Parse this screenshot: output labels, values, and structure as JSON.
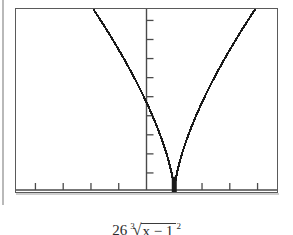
{
  "figure": {
    "kind": "graphing-calculator-screen",
    "frame_color": "#5a5a5a",
    "curve_color": "#1a1a1a",
    "background": "#ffffff"
  },
  "caption": {
    "coefficient": "26",
    "root_index": "3",
    "radical_symbol": "√",
    "radicand": "x − 1",
    "exponent": "2",
    "full_text": "26 ∛(x − 1)²"
  },
  "chart_data": {
    "type": "line",
    "title": "",
    "subtitle": "",
    "xlabel": "",
    "ylabel": "",
    "legend": [],
    "legend_position": "none",
    "grid": false,
    "axis_style": "calculator-crosshair",
    "xlim": [
      -4.7,
      4.7
    ],
    "ylim": [
      0,
      48
    ],
    "x_tick_count": 9,
    "y_tick_count": 9,
    "x_tick_values": [
      -4,
      -3,
      -2,
      -1,
      0,
      1,
      2,
      3,
      4
    ],
    "y_tick_values": [
      5,
      10,
      15,
      20,
      25,
      30,
      35,
      40,
      45
    ],
    "y_axis_x_value": 0,
    "cusp_x": 1,
    "cusp_y": 0,
    "equation": "y = 26 * cbrt((x - 1)^2)",
    "series": [
      {
        "name": "26 cbrt((x-1)^2)",
        "x": [
          -4.7,
          -4.4,
          -4.1,
          -3.8,
          -3.5,
          -3.2,
          -2.9,
          -2.6,
          -2.3,
          -2.0,
          -1.7,
          -1.4,
          -1.1,
          -0.8,
          -0.5,
          -0.2,
          0.1,
          0.4,
          0.7,
          0.85,
          1.0,
          1.15,
          1.3,
          1.6,
          1.9,
          2.2,
          2.5,
          2.8,
          3.1,
          3.4,
          3.7,
          4.0,
          4.3,
          4.6,
          4.7
        ],
        "y": [
          82.3,
          79.1,
          75.8,
          72.5,
          69.2,
          65.8,
          62.3,
          58.8,
          55.2,
          51.5,
          47.7,
          43.7,
          39.6,
          35.3,
          30.7,
          25.8,
          20.4,
          14.2,
          12.1,
          8.0,
          0.0,
          8.0,
          12.1,
          18.6,
          23.7,
          28.3,
          32.4,
          36.2,
          39.8,
          43.2,
          46.4,
          49.5,
          52.5,
          55.3,
          56.2
        ],
        "style": "solid",
        "color": "#1a1a1a"
      }
    ],
    "annotations": [
      {
        "name": "cusp-stem",
        "description": "thick vertical segment at the cusp where the curve meets the x-axis",
        "x": 1,
        "y_from": 0,
        "y_to": 4
      }
    ]
  }
}
